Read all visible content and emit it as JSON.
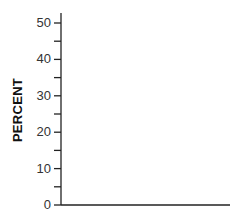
{
  "chart_data": {
    "type": "bar",
    "title": "",
    "xlabel": "",
    "ylabel": "PERCENT",
    "ylim": [
      0,
      52
    ],
    "yticks_major": [
      0,
      10,
      20,
      30,
      40,
      50
    ],
    "yticks_minor": [
      5,
      15,
      25,
      35,
      45
    ],
    "categories": [],
    "values": [],
    "grid": false,
    "legend": null
  },
  "axis": {
    "ylabel": "PERCENT",
    "tick_labels": [
      "0",
      "10",
      "20",
      "30",
      "40",
      "50"
    ]
  }
}
